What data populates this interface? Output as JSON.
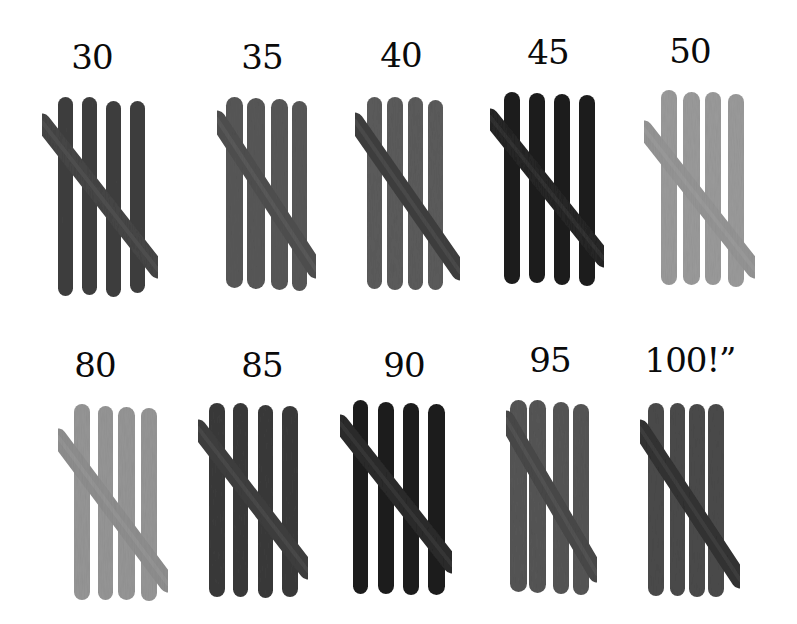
{
  "image": {
    "description": "Tally marks made of popsicle sticks counting to 100 by fives",
    "background": "#ffffff"
  },
  "groups": [
    {
      "label": "30",
      "label_x": 92,
      "label_y": 40,
      "tone": "#3f3f3f",
      "diag_tone": "#454545",
      "sticks": [
        [
          58,
          97,
          73,
          296
        ],
        [
          82,
          97,
          97,
          295
        ],
        [
          106,
          101,
          121,
          297
        ],
        [
          130,
          101,
          145,
          293
        ]
      ],
      "diag": [
        [
          42,
          122
        ],
        [
          158,
          270
        ]
      ]
    },
    {
      "label": "35",
      "label_x": 262,
      "label_y": 40,
      "tone": "#575757",
      "diag_tone": "#4f4f4f",
      "sticks": [
        [
          226,
          97,
          243,
          288
        ],
        [
          247,
          98,
          265,
          289
        ],
        [
          271,
          99,
          288,
          290
        ],
        [
          292,
          101,
          307,
          291
        ]
      ],
      "diag": [
        [
          217,
          119
        ],
        [
          316,
          270
        ]
      ]
    },
    {
      "label": "40",
      "label_x": 401,
      "label_y": 38,
      "tone": "#5b5b5b",
      "diag_tone": "#3f3f3f",
      "sticks": [
        [
          367,
          97,
          382,
          289
        ],
        [
          387,
          97,
          403,
          290
        ],
        [
          408,
          97,
          423,
          290
        ],
        [
          428,
          100,
          443,
          290
        ]
      ],
      "diag": [
        [
          355,
          121
        ],
        [
          460,
          272
        ]
      ]
    },
    {
      "label": "45",
      "label_x": 548,
      "label_y": 35,
      "tone": "#1c1c1c",
      "diag_tone": "#252525",
      "sticks": [
        [
          504,
          92,
          520,
          284
        ],
        [
          529,
          93,
          545,
          283
        ],
        [
          554,
          94,
          570,
          285
        ],
        [
          579,
          95,
          595,
          286
        ]
      ],
      "diag": [
        [
          490,
          117
        ],
        [
          604,
          259
        ]
      ]
    },
    {
      "label": "50",
      "label_x": 690,
      "label_y": 34,
      "tone": "#9a9a9a",
      "diag_tone": "#949494",
      "sticks": [
        [
          661,
          90,
          677,
          285
        ],
        [
          683,
          92,
          700,
          285
        ],
        [
          705,
          92,
          721,
          285
        ],
        [
          728,
          94,
          744,
          287
        ]
      ],
      "diag": [
        [
          644,
          129
        ],
        [
          755,
          270
        ]
      ]
    },
    {
      "label": "80",
      "label_x": 95,
      "label_y": 348,
      "tone": "#959595",
      "diag_tone": "#8e8e8e",
      "sticks": [
        [
          74,
          404,
          90,
          600
        ],
        [
          98,
          406,
          113,
          600
        ],
        [
          118,
          407,
          135,
          600
        ],
        [
          141,
          408,
          157,
          601
        ]
      ],
      "diag": [
        [
          58,
          437
        ],
        [
          168,
          584
        ]
      ]
    },
    {
      "label": "85",
      "label_x": 262,
      "label_y": 348,
      "tone": "#3a3a3a",
      "diag_tone": "#3e3e3e",
      "sticks": [
        [
          209,
          403,
          225,
          597
        ],
        [
          233,
          403,
          248,
          597
        ],
        [
          258,
          405,
          273,
          598
        ],
        [
          282,
          406,
          298,
          597
        ]
      ],
      "diag": [
        [
          198,
          428
        ],
        [
          308,
          571
        ]
      ]
    },
    {
      "label": "90",
      "label_x": 404,
      "label_y": 348,
      "tone": "#1e1e1e",
      "diag_tone": "#2a2a2a",
      "sticks": [
        [
          353,
          400,
          368,
          594
        ],
        [
          378,
          402,
          394,
          594
        ],
        [
          403,
          403,
          419,
          595
        ],
        [
          428,
          404,
          445,
          595
        ]
      ],
      "diag": [
        [
          340,
          423
        ],
        [
          452,
          565
        ]
      ]
    },
    {
      "label": "95",
      "label_x": 550,
      "label_y": 343,
      "tone": "#555555",
      "diag_tone": "#484848",
      "sticks": [
        [
          510,
          400,
          527,
          592
        ],
        [
          529,
          400,
          546,
          593
        ],
        [
          553,
          402,
          569,
          594
        ],
        [
          573,
          404,
          589,
          595
        ]
      ],
      "diag": [
        [
          506,
          419
        ],
        [
          597,
          574
        ]
      ]
    },
    {
      "label": "100!”",
      "label_x": 690,
      "label_y": 343,
      "tone": "#4a4a4a",
      "diag_tone": "#323232",
      "sticks": [
        [
          648,
          403,
          664,
          596
        ],
        [
          670,
          403,
          685,
          596
        ],
        [
          689,
          404,
          705,
          597
        ],
        [
          708,
          404,
          724,
          597
        ]
      ],
      "diag": [
        [
          640,
          428
        ],
        [
          740,
          580
        ]
      ]
    }
  ],
  "stick_width": 16
}
